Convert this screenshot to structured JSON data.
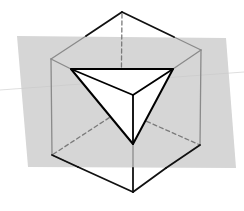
{
  "diagram": {
    "width": 244,
    "height": 211,
    "colors": {
      "background": "#ffffff",
      "plane": "#d6d6d6",
      "edge_visible": "#111111",
      "edge_inside_plane": "#8a8a8a",
      "edge_hidden": "#7a7a7a",
      "section_fill": "#ffffff",
      "section_stroke": "#000000",
      "artifact_line": "#c9c9c9"
    },
    "plane": {
      "points": [
        [
          17,
          36
        ],
        [
          226,
          38
        ],
        [
          236,
          168
        ],
        [
          28,
          167
        ]
      ]
    },
    "vertices": {
      "top": [
        122,
        12
      ],
      "left_top": [
        51,
        59
      ],
      "right_top": [
        201,
        50
      ],
      "front_top": [
        133,
        95
      ],
      "left_bottom": [
        52,
        155
      ],
      "right_bottom": [
        200,
        145
      ],
      "bottom": [
        133,
        192
      ],
      "back_hidden": [
        121,
        110
      ]
    },
    "edges_visible_outside_plane": [
      [
        [
          122,
          12
        ],
        [
          86,
          36
        ]
      ],
      [
        [
          122,
          12
        ],
        [
          174,
          37
        ]
      ],
      [
        [
          52,
          155
        ],
        [
          78,
          167
        ]
      ],
      [
        [
          200,
          145
        ],
        [
          166,
          168
        ]
      ],
      [
        [
          78,
          167
        ],
        [
          133,
          192
        ]
      ],
      [
        [
          166,
          168
        ],
        [
          133,
          192
        ]
      ],
      [
        [
          133,
          168
        ],
        [
          133,
          192
        ]
      ]
    ],
    "edges_inside_plane": [
      [
        [
          86,
          36
        ],
        [
          51,
          59
        ]
      ],
      [
        [
          174,
          37
        ],
        [
          201,
          50
        ]
      ],
      [
        [
          51,
          59
        ],
        [
          52,
          155
        ]
      ],
      [
        [
          201,
          50
        ],
        [
          200,
          145
        ]
      ],
      [
        [
          51,
          59
        ],
        [
          71,
          69
        ]
      ],
      [
        [
          201,
          50
        ],
        [
          173,
          69
        ]
      ],
      [
        [
          52,
          155
        ],
        [
          78,
          167
        ]
      ],
      [
        [
          133,
          144
        ],
        [
          133,
          168
        ]
      ]
    ],
    "edges_hidden": [
      [
        [
          122,
          14
        ],
        [
          121,
          110
        ]
      ],
      [
        [
          121,
          110
        ],
        [
          52,
          155
        ]
      ],
      [
        [
          121,
          110
        ],
        [
          200,
          145
        ]
      ]
    ],
    "section_triangle": {
      "points": [
        [
          71,
          69
        ],
        [
          173,
          69
        ],
        [
          133,
          144
        ]
      ],
      "inner_edges": [
        [
          [
            71,
            69
          ],
          [
            133,
            95
          ]
        ],
        [
          [
            173,
            69
          ],
          [
            133,
            95
          ]
        ],
        [
          [
            133,
            95
          ],
          [
            133,
            144
          ]
        ]
      ]
    },
    "artifact_line": [
      [
        0,
        90
      ],
      [
        244,
        72
      ]
    ]
  }
}
